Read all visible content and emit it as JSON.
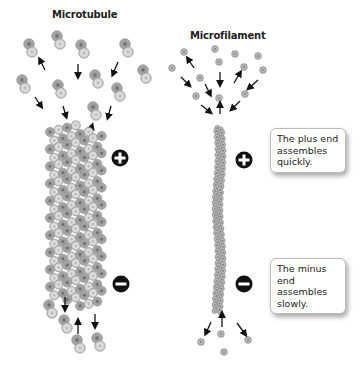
{
  "titles": {
    "microtubule": "Microtubule",
    "microfilament": "Microfilament"
  },
  "callouts": {
    "plus": "The plus end assembles quickly.",
    "minus": "The minus end assembles slowly."
  },
  "symbols": {
    "plus": "plus-sign",
    "minus": "minus-sign"
  },
  "colors": {
    "subunit_dark": "#8a8a8a",
    "subunit_light": "#c8c8c8",
    "arrow": "#111111",
    "sign_fill": "#111111"
  }
}
